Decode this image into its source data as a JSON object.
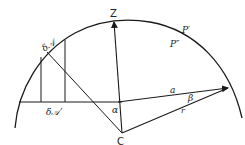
{
  "diagram": {
    "labels": {
      "zenith": "Z",
      "p_prime": "P′",
      "p_double_prime": "P″",
      "delta_arc_top": "δ𝒜",
      "delta_arc_bottom": "δ𝒜′",
      "alpha": "α",
      "a": "a",
      "beta": "β",
      "r": "r",
      "center": "C"
    },
    "colors": {
      "stroke": "#1a1a1a",
      "background": "#ffffff"
    }
  }
}
